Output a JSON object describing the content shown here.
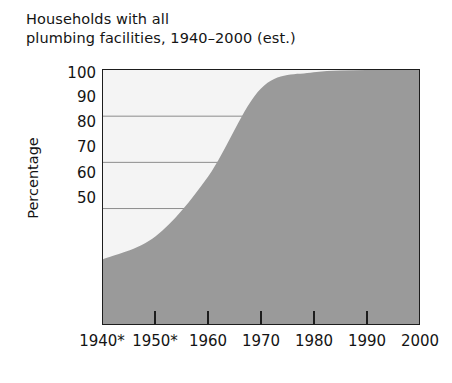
{
  "chart_data": {
    "type": "area",
    "title": "Households with all\nplumbing facilities, 1940–2000 (est.)",
    "xlabel": "",
    "ylabel": "Percentage",
    "categories": [
      "1940*",
      "1950*",
      "1960",
      "1970",
      "1980",
      "1990",
      "2000"
    ],
    "x": [
      1940,
      1950,
      1960,
      1970,
      1980,
      1990,
      2000
    ],
    "values": [
      59,
      64,
      77,
      96,
      99.5,
      100,
      100
    ],
    "series": [
      {
        "name": "Households with all plumbing facilities",
        "values": [
          59,
          64,
          77,
          96,
          99.5,
          100,
          100
        ]
      }
    ],
    "points": [
      {
        "year": 1940,
        "label": "1940*",
        "value": 59
      },
      {
        "year": 1950,
        "label": "1950*",
        "value": 64
      },
      {
        "year": 1960,
        "label": "1960",
        "value": 77
      },
      {
        "year": 1970,
        "label": "1970",
        "value": 96
      },
      {
        "year": 1980,
        "label": "1980",
        "value": 99.5
      },
      {
        "year": 1990,
        "label": "1990",
        "value": 100
      },
      {
        "year": 2000,
        "label": "2000",
        "value": 100
      }
    ],
    "y_ticks": [
      100,
      90,
      80,
      70,
      60,
      50
    ],
    "y_tick_labels": [
      "100",
      "90",
      "80",
      "70",
      "60",
      "50"
    ],
    "ylim": [
      45,
      100
    ],
    "xlim": [
      1940,
      2000
    ],
    "gridlines_at": [
      90,
      80,
      70
    ],
    "grid": true,
    "legend": "none",
    "footnote_marker": "*",
    "colors": {
      "area_fill": "#9a9a9a",
      "plot_background": "#f4f4f4",
      "axis": "#1d1d1d",
      "gridline": "#8c8c8c",
      "text": "#141414"
    }
  },
  "y_tick_positions_px": [
    73,
    97,
    122,
    147,
    173,
    198
  ],
  "x_tick_positions_px": [
    102,
    155,
    208,
    261,
    314,
    367,
    420
  ]
}
